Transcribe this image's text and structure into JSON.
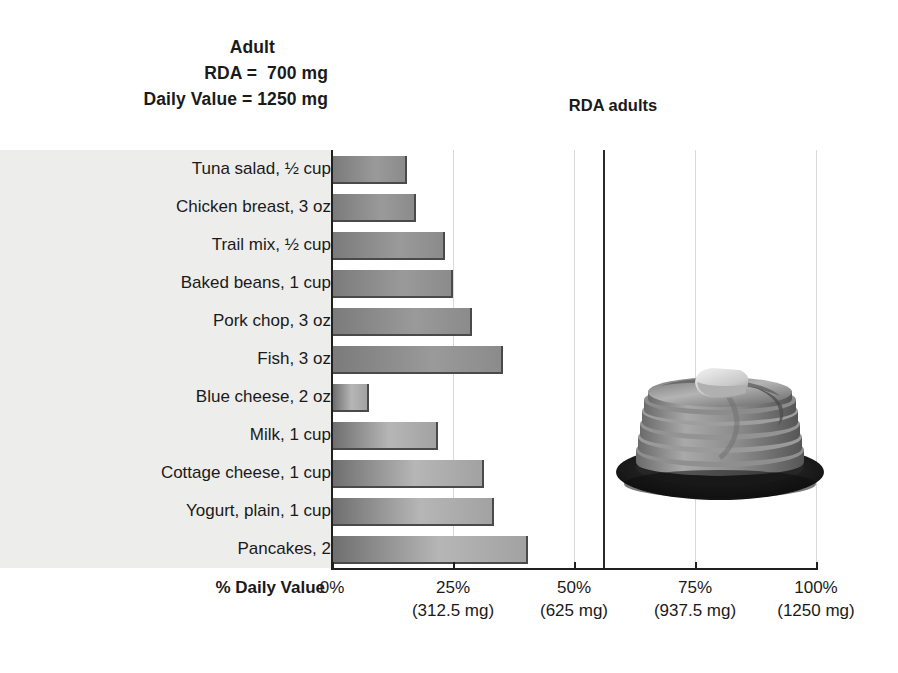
{
  "header": {
    "adult_label": "Adult",
    "rda_line": "RDA =  700 mg",
    "daily_value_line": "Daily Value = 1250 mg"
  },
  "annotations": {
    "rda_adults": "RDA adults"
  },
  "axis": {
    "title": "% Daily Value"
  },
  "photo": {
    "alt_name": "pancake-stack-photo"
  },
  "chart_data": {
    "type": "bar",
    "orientation": "horizontal",
    "title": "",
    "xlabel": "% Daily Value",
    "ylabel": "",
    "xlim": [
      0,
      100
    ],
    "grid": true,
    "legend": false,
    "categories": [
      "Tuna salad, ½ cup",
      "Chicken breast, 3 oz",
      "Trail mix, ½ cup",
      "Baked beans, 1 cup",
      "Pork chop, 3 oz",
      "Fish, 3 oz",
      "Blue cheese, 2 oz",
      "Milk, 1 cup",
      "Cottage cheese, 1 cup",
      "Yogurt, plain, 1 cup",
      "Pancakes, 2"
    ],
    "values": [
      15,
      17,
      23,
      24.5,
      28.5,
      35,
      7.3,
      21.5,
      31,
      33,
      40
    ],
    "value_unit": "% Daily Value",
    "tick_values": [
      0,
      25,
      50,
      75,
      100
    ],
    "tick_labels": [
      "0%",
      "25%",
      "50%",
      "75%",
      "100%"
    ],
    "tick_sublabels": [
      "",
      "(312.5 mg)",
      "(625 mg)",
      "(937.5 mg)",
      "(1250 mg)"
    ],
    "reference_lines": [
      {
        "label": "RDA adults",
        "value": 56,
        "value_mg": 700,
        "color": "#2b2b2b"
      }
    ],
    "reference_values": {
      "adult_rda_mg": 700,
      "daily_value_mg": 1250
    },
    "colors": {
      "bar_fill_light": "#9a9a9a",
      "bar_fill_dark": "#6f6f6f",
      "bar_edge": "#4a4a4a",
      "axis": "#231f20",
      "grid": "#d9d9d9",
      "label_panel_bg": "#ededeb"
    }
  }
}
